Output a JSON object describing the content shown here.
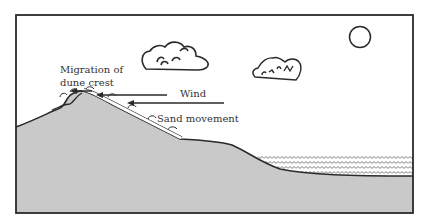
{
  "diagram": {
    "type": "dune cross-section",
    "labels": {
      "migration_line1": "Migration of",
      "migration_line2": "dune crest",
      "wind": "Wind",
      "sand_movement": "Sand movement"
    },
    "elements": {
      "clouds": 2,
      "sun": 1,
      "wind_arrows": 2,
      "migration_arrow": 1,
      "water_body": "zigzag wave pattern on right side"
    },
    "colors": {
      "ground_fill": "#c9c9c9",
      "outline": "#2a2a2a",
      "background": "#ffffff"
    }
  }
}
